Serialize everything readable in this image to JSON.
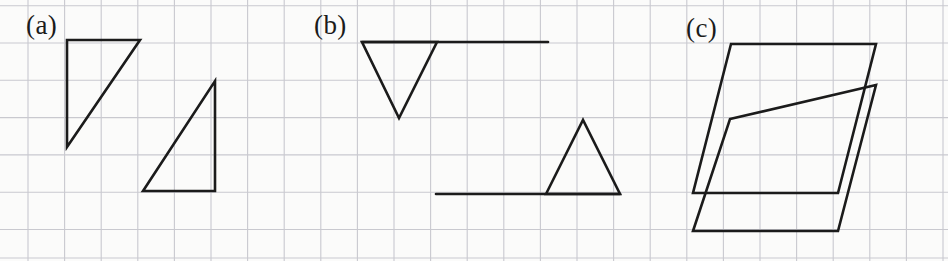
{
  "figure": {
    "width": 948,
    "height": 261,
    "background_color": "#fbfbfa",
    "paper_type": "graph-paper-scan"
  },
  "grid": {
    "line_color": "#c9c9cf",
    "line_width": 1.1,
    "spacing_x": 36.6,
    "spacing_y": 37.3,
    "origin_x": 28,
    "origin_y": 43,
    "vertical_lines": [
      28,
      64.6,
      101.2,
      137.8,
      174.4,
      211,
      247.6,
      284.2,
      320.8,
      357.4,
      394,
      430.6,
      467.2,
      503.8,
      540.4,
      577,
      613.6,
      650.2,
      686.8,
      723.4,
      760,
      796.6,
      833.2,
      869.8,
      906.4,
      943
    ],
    "horizontal_lines": [
      5.7,
      43,
      80.3,
      117.6,
      154.9,
      192.2,
      229.5,
      258
    ]
  },
  "ink": {
    "stroke_color": "#1b1b1b",
    "stroke_width": 2.6,
    "stroke_linejoin": "miter",
    "stroke_linecap": "round"
  },
  "labels": {
    "a": "(a)",
    "b": "(b)",
    "c": "(c)"
  },
  "panels": [
    {
      "id": "a",
      "label": "(a)",
      "label_position": {
        "x": 26,
        "y": 12
      },
      "shape_count": 2,
      "shapes": [
        {
          "name": "right-triangle-upper-left",
          "kind": "polygon",
          "closed": true,
          "points": [
            [
              67,
              40
            ],
            [
              140,
              40
            ],
            [
              67,
              147
            ]
          ]
        },
        {
          "name": "right-triangle-lower-right",
          "kind": "polygon",
          "closed": true,
          "points": [
            [
              215,
              81
            ],
            [
              215,
              191
            ],
            [
              143,
              191
            ]
          ]
        }
      ]
    },
    {
      "id": "b",
      "label": "(b)",
      "label_position": {
        "x": 314,
        "y": 12
      },
      "shape_count": 4,
      "shapes": [
        {
          "name": "horizontal-segment-upper",
          "kind": "polyline",
          "closed": false,
          "points": [
            [
              362,
              42
            ],
            [
              548,
              42
            ]
          ]
        },
        {
          "name": "downward-triangle",
          "kind": "polygon",
          "closed": true,
          "points": [
            [
              362,
              42
            ],
            [
              437,
              42
            ],
            [
              399,
              118
            ]
          ]
        },
        {
          "name": "horizontal-segment-lower",
          "kind": "polyline",
          "closed": false,
          "points": [
            [
              436,
              194
            ],
            [
              620,
              194
            ]
          ]
        },
        {
          "name": "upward-triangle",
          "kind": "polygon",
          "closed": true,
          "points": [
            [
              546,
              194
            ],
            [
              583,
              120
            ],
            [
              620,
              194
            ]
          ]
        }
      ]
    },
    {
      "id": "c",
      "label": "(c)",
      "label_position": {
        "x": 686,
        "y": 15
      },
      "shape_count": 2,
      "shapes": [
        {
          "name": "parallelogram-upper",
          "kind": "polygon",
          "closed": true,
          "points": [
            [
              731,
              44
            ],
            [
              876,
              44
            ],
            [
              838,
              193
            ],
            [
              693,
              193
            ]
          ]
        },
        {
          "name": "parallelogram-lower",
          "kind": "polygon",
          "closed": true,
          "points": [
            [
              730,
              119
            ],
            [
              876,
              85
            ],
            [
              838,
              231
            ],
            [
              693,
              231
            ]
          ]
        }
      ]
    }
  ]
}
